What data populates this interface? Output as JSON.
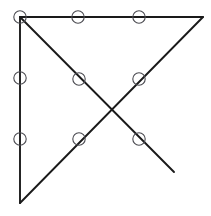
{
  "figure": {
    "canvas": {
      "width": 211,
      "height": 216,
      "background": "#ffffff"
    },
    "colors": {
      "line": "#1a1a1a",
      "circle_stroke": "#4a4a50",
      "background": "#ffffff"
    },
    "style": {
      "line_width": 1.9,
      "circle_radius": 6.2,
      "circle_stroke_width": 1.1
    },
    "vertices": {
      "top_left": {
        "x": 20,
        "y": 17
      },
      "top_right": {
        "x": 203,
        "y": 17
      },
      "bottom_left": {
        "x": 20,
        "y": 203
      },
      "crossing": {
        "x": 110,
        "y": 110
      },
      "diagonal_free_end": {
        "x": 174,
        "y": 172
      }
    },
    "segments": [
      {
        "name": "top-edge",
        "x1": 20,
        "y1": 17,
        "x2": 203,
        "y2": 17
      },
      {
        "name": "left-edge",
        "x1": 20,
        "y1": 17,
        "x2": 20,
        "y2": 203
      },
      {
        "name": "ascending-hypotenuse",
        "x1": 20,
        "y1": 203,
        "x2": 203,
        "y2": 17
      },
      {
        "name": "descending-diagonal",
        "x1": 20,
        "y1": 17,
        "x2": 174,
        "y2": 172
      }
    ],
    "nodes": [
      {
        "name": "node-top-left-vertex",
        "x": 20,
        "y": 17,
        "r": 6.2,
        "on": "top-left-vertex"
      },
      {
        "name": "node-top-edge-1",
        "x": 78,
        "y": 17,
        "r": 6.2,
        "on": "top-edge"
      },
      {
        "name": "node-top-edge-2",
        "x": 139,
        "y": 17,
        "r": 6.2,
        "on": "top-edge"
      },
      {
        "name": "node-left-edge-1",
        "x": 20,
        "y": 78,
        "r": 6.2,
        "on": "left-edge"
      },
      {
        "name": "node-left-edge-2",
        "x": 20,
        "y": 139,
        "r": 6.2,
        "on": "left-edge"
      },
      {
        "name": "node-descending-upper",
        "x": 79,
        "y": 79,
        "r": 6.2,
        "on": "descending-diagonal"
      },
      {
        "name": "node-ascending-upper",
        "x": 139,
        "y": 79,
        "r": 6.2,
        "on": "ascending-hypotenuse"
      },
      {
        "name": "node-ascending-lower",
        "x": 79,
        "y": 139,
        "r": 6.2,
        "on": "ascending-hypotenuse"
      },
      {
        "name": "node-descending-lower",
        "x": 139,
        "y": 139,
        "r": 6.2,
        "on": "descending-diagonal"
      }
    ]
  }
}
